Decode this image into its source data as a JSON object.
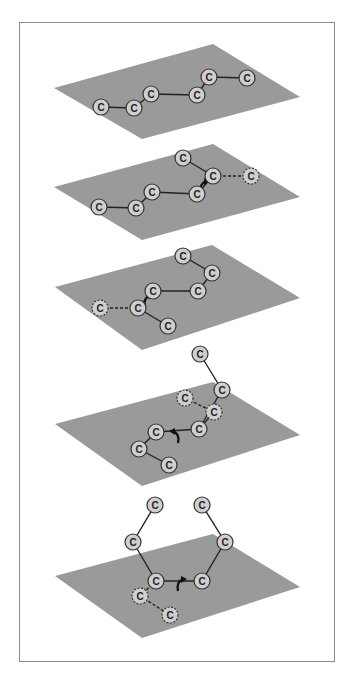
{
  "figure": {
    "colors": {
      "plane": "#9a9a9a",
      "atom_fill": "#cfcfcf",
      "atom_stroke": "#333333",
      "bond": "#222222",
      "frame": "#8a8a8a",
      "arrow": "#111111"
    },
    "atom_label": "C",
    "panels": [
      {
        "plane": [
          [
            54,
            88
          ],
          [
            213,
            44
          ],
          [
            300,
            97
          ],
          [
            142,
            139
          ]
        ],
        "atoms": [
          {
            "x": 101,
            "y": 107,
            "label": "C",
            "ghost": false
          },
          {
            "x": 134,
            "y": 108,
            "label": "C",
            "ghost": false
          },
          {
            "x": 151,
            "y": 94,
            "label": "C",
            "ghost": false
          },
          {
            "x": 197,
            "y": 95,
            "label": "C",
            "ghost": false
          },
          {
            "x": 209,
            "y": 77,
            "label": "C",
            "ghost": false
          },
          {
            "x": 247,
            "y": 78,
            "label": "C",
            "ghost": false
          }
        ],
        "bonds": [
          [
            0,
            1,
            "solid"
          ],
          [
            1,
            2,
            "solid"
          ],
          [
            2,
            3,
            "solid"
          ],
          [
            3,
            4,
            "solid"
          ],
          [
            4,
            5,
            "solid"
          ]
        ],
        "arrow": null
      },
      {
        "plane": [
          [
            54,
            187
          ],
          [
            213,
            144
          ],
          [
            300,
            197
          ],
          [
            142,
            240
          ]
        ],
        "atoms": [
          {
            "x": 99,
            "y": 207,
            "label": "C",
            "ghost": false
          },
          {
            "x": 136,
            "y": 208,
            "label": "C",
            "ghost": false
          },
          {
            "x": 152,
            "y": 192,
            "label": "C",
            "ghost": false
          },
          {
            "x": 197,
            "y": 194,
            "label": "C",
            "ghost": false
          },
          {
            "x": 213,
            "y": 176,
            "label": "C",
            "ghost": false
          },
          {
            "x": 251,
            "y": 176,
            "label": "C",
            "ghost": true
          },
          {
            "x": 183,
            "y": 158,
            "label": "C",
            "ghost": false
          }
        ],
        "bonds": [
          [
            0,
            1,
            "solid"
          ],
          [
            1,
            2,
            "solid"
          ],
          [
            2,
            3,
            "solid"
          ],
          [
            3,
            4,
            "solid"
          ],
          [
            4,
            6,
            "solid"
          ],
          [
            4,
            5,
            "dashed"
          ]
        ],
        "arrow": {
          "x": 203,
          "y": 186,
          "dir": "cw"
        }
      },
      {
        "plane": [
          [
            55,
            287
          ],
          [
            212,
            245
          ],
          [
            300,
            298
          ],
          [
            142,
            350
          ]
        ],
        "atoms": [
          {
            "x": 100,
            "y": 308,
            "label": "C",
            "ghost": true
          },
          {
            "x": 138,
            "y": 308,
            "label": "C",
            "ghost": false
          },
          {
            "x": 153,
            "y": 291,
            "label": "C",
            "ghost": false
          },
          {
            "x": 198,
            "y": 291,
            "label": "C",
            "ghost": false
          },
          {
            "x": 212,
            "y": 273,
            "label": "C",
            "ghost": false
          },
          {
            "x": 183,
            "y": 256,
            "label": "C",
            "ghost": false
          },
          {
            "x": 168,
            "y": 326,
            "label": "C",
            "ghost": false
          }
        ],
        "bonds": [
          [
            0,
            1,
            "dashed"
          ],
          [
            1,
            2,
            "solid"
          ],
          [
            2,
            3,
            "solid"
          ],
          [
            3,
            4,
            "solid"
          ],
          [
            4,
            5,
            "solid"
          ],
          [
            1,
            6,
            "solid"
          ]
        ],
        "arrow": {
          "x": 147,
          "y": 300,
          "dir": "cw"
        }
      },
      {
        "plane": [
          [
            55,
            424
          ],
          [
            213,
            382
          ],
          [
            300,
            435
          ],
          [
            142,
            486
          ]
        ],
        "atoms": [
          {
            "x": 200,
            "y": 354,
            "label": "C",
            "ghost": false
          },
          {
            "x": 222,
            "y": 390,
            "label": "C",
            "ghost": false
          },
          {
            "x": 185,
            "y": 398,
            "label": "C",
            "ghost": true
          },
          {
            "x": 214,
            "y": 412,
            "label": "C",
            "ghost": true
          },
          {
            "x": 199,
            "y": 429,
            "label": "C",
            "ghost": false
          },
          {
            "x": 156,
            "y": 432,
            "label": "C",
            "ghost": false
          },
          {
            "x": 139,
            "y": 449,
            "label": "C",
            "ghost": false
          },
          {
            "x": 169,
            "y": 465,
            "label": "C",
            "ghost": false
          }
        ],
        "bonds": [
          [
            0,
            1,
            "solid"
          ],
          [
            1,
            4,
            "solid"
          ],
          [
            2,
            3,
            "dashed"
          ],
          [
            3,
            4,
            "solid"
          ],
          [
            4,
            5,
            "solid"
          ],
          [
            5,
            6,
            "solid"
          ],
          [
            6,
            7,
            "solid"
          ]
        ],
        "arrow": {
          "x": 176,
          "y": 436,
          "dir": "ccw"
        }
      },
      {
        "plane": [
          [
            55,
            576
          ],
          [
            213,
            534
          ],
          [
            300,
            587
          ],
          [
            142,
            638
          ]
        ],
        "atoms": [
          {
            "x": 155,
            "y": 505,
            "label": "C",
            "ghost": false
          },
          {
            "x": 202,
            "y": 505,
            "label": "C",
            "ghost": false
          },
          {
            "x": 133,
            "y": 542,
            "label": "C",
            "ghost": false
          },
          {
            "x": 225,
            "y": 542,
            "label": "C",
            "ghost": false
          },
          {
            "x": 156,
            "y": 581,
            "label": "C",
            "ghost": false
          },
          {
            "x": 202,
            "y": 581,
            "label": "C",
            "ghost": false
          },
          {
            "x": 140,
            "y": 596,
            "label": "C",
            "ghost": true
          },
          {
            "x": 170,
            "y": 615,
            "label": "C",
            "ghost": true
          }
        ],
        "bonds": [
          [
            0,
            2,
            "solid"
          ],
          [
            2,
            4,
            "solid"
          ],
          [
            1,
            3,
            "solid"
          ],
          [
            3,
            5,
            "solid"
          ],
          [
            4,
            5,
            "solid"
          ],
          [
            4,
            6,
            "dashed"
          ],
          [
            6,
            7,
            "dashed"
          ]
        ],
        "arrow": {
          "x": 180,
          "y": 584,
          "dir": "cw"
        }
      }
    ]
  }
}
